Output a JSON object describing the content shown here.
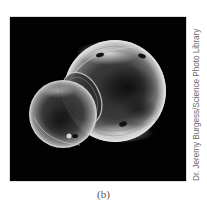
{
  "figure": {
    "label": "(b)",
    "credit": "Dr. Jeremy Burgess/Science Photo Library",
    "photo": {
      "subject": "two-soap-bubbles-joined",
      "background_color": "#020202",
      "bubbles": [
        {
          "name": "large-bubble",
          "cx": 105,
          "cy": 74,
          "r": 51
        },
        {
          "name": "small-bubble",
          "cx": 53,
          "cy": 97,
          "r": 34
        }
      ]
    }
  }
}
